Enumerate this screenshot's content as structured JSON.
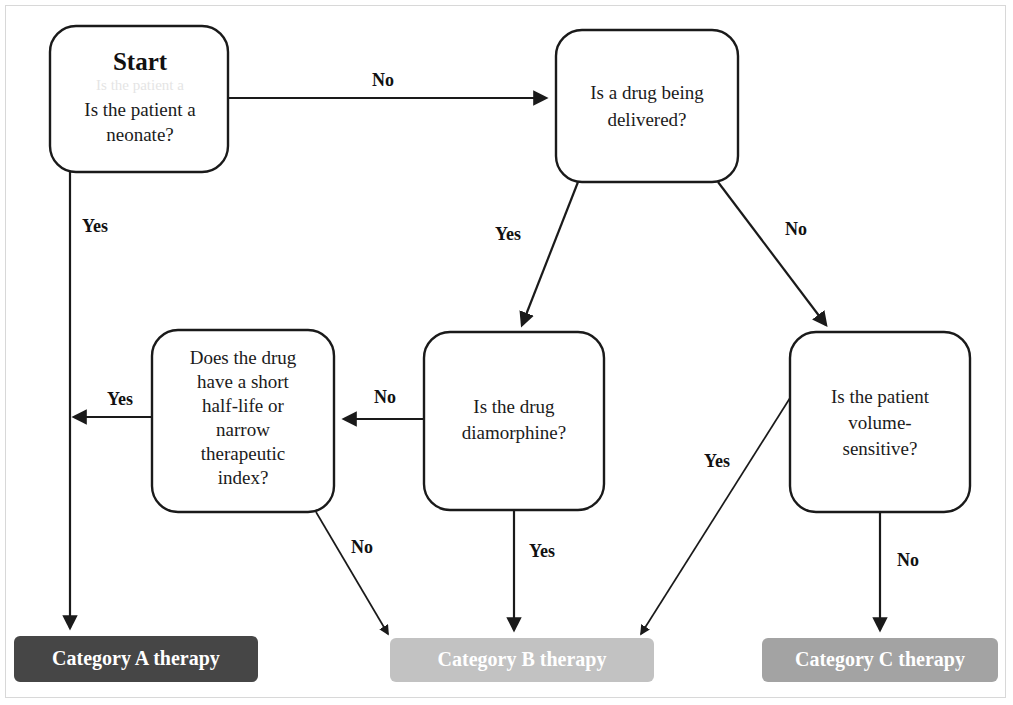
{
  "diagram": {
    "type": "flowchart",
    "title_node": "Start",
    "ghost_artifact": "Is the patient a",
    "nodes": [
      {
        "id": "start",
        "label_title": "Start",
        "label": "Is the patient a neonate?",
        "lines": [
          "Is the patient a",
          "neonate?"
        ]
      },
      {
        "id": "drug",
        "label": "Is a drug being delivered?",
        "lines": [
          "Is a drug being",
          "delivered?"
        ]
      },
      {
        "id": "halflife",
        "label": "Does the drug have a short half-life or narrow therapeutic index?",
        "lines": [
          "Does the drug",
          "have a short",
          "half-life or",
          "narrow",
          "therapeutic",
          "index?"
        ]
      },
      {
        "id": "diamorphine",
        "label": "Is the drug diamorphine?",
        "lines": [
          "Is the drug",
          "diamorphine?"
        ]
      },
      {
        "id": "volume",
        "label": "Is the patient volume-sensitive?",
        "lines": [
          "Is the patient",
          "volume-",
          "sensitive?"
        ]
      }
    ],
    "terminals": [
      {
        "id": "cat_a",
        "label": "Category A therapy",
        "color": "#464646"
      },
      {
        "id": "cat_b",
        "label": "Category B therapy",
        "color": "#c2c2c2"
      },
      {
        "id": "cat_c",
        "label": "Category C therapy",
        "color": "#a3a3a3"
      }
    ],
    "edges": [
      {
        "from": "start",
        "to": "drug",
        "label": "No"
      },
      {
        "from": "start",
        "to": "cat_a",
        "label": "Yes"
      },
      {
        "from": "drug",
        "to": "diamorphine",
        "label": "Yes"
      },
      {
        "from": "drug",
        "to": "volume",
        "label": "No"
      },
      {
        "from": "diamorphine",
        "to": "halflife",
        "label": "No"
      },
      {
        "from": "diamorphine",
        "to": "cat_b",
        "label": "Yes"
      },
      {
        "from": "halflife",
        "to": "cat_a",
        "label": "Yes"
      },
      {
        "from": "halflife",
        "to": "cat_b",
        "label": "No"
      },
      {
        "from": "volume",
        "to": "cat_b",
        "label": "Yes"
      },
      {
        "from": "volume",
        "to": "cat_c",
        "label": "No"
      }
    ],
    "labels": {
      "start_no": "No",
      "start_yes": "Yes",
      "drug_yes": "Yes",
      "drug_no": "No",
      "diamorphine_no": "No",
      "diamorphine_yes": "Yes",
      "halflife_yes": "Yes",
      "halflife_no": "No",
      "volume_yes": "Yes",
      "volume_no": "No"
    },
    "colors": {
      "stroke": "#1a1a1a",
      "node_fill": "#ffffff",
      "cat_a": "#464646",
      "cat_b": "#c2c2c2",
      "cat_c": "#a3a3a3",
      "page_border": "#d8d8d8",
      "background": "#ffffff"
    }
  }
}
